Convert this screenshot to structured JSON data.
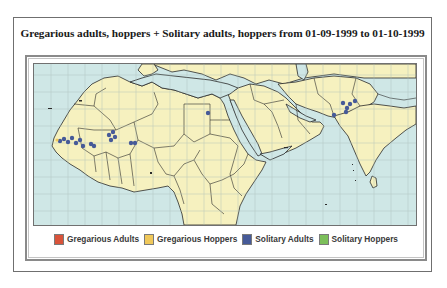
{
  "title": "Gregarious adults, hoppers + Solitary adults, hoppers from 01-09-1999 to 01-10-1999",
  "map": {
    "colors": {
      "sea": "#cfe7e6",
      "land": "#f6f1bf",
      "border": "#2a2a2a",
      "grid": "#a9bdbb"
    },
    "grid_spacing_px": 17,
    "observations": [
      {
        "type": "solitary_adults",
        "region": "Mauritania",
        "x": 26,
        "y": 77
      },
      {
        "type": "solitary_adults",
        "region": "Mauritania",
        "x": 30,
        "y": 75
      },
      {
        "type": "solitary_adults",
        "region": "Mauritania",
        "x": 34,
        "y": 78
      },
      {
        "type": "solitary_adults",
        "region": "Mauritania",
        "x": 38,
        "y": 74
      },
      {
        "type": "solitary_adults",
        "region": "Mauritania",
        "x": 42,
        "y": 79
      },
      {
        "type": "solitary_adults",
        "region": "Mauritania",
        "x": 46,
        "y": 76
      },
      {
        "type": "solitary_adults",
        "region": "Mauritania",
        "x": 49,
        "y": 82
      },
      {
        "type": "solitary_adults",
        "region": "Mali",
        "x": 57,
        "y": 80
      },
      {
        "type": "solitary_adults",
        "region": "Mali",
        "x": 60,
        "y": 82
      },
      {
        "type": "solitary_adults",
        "region": "Mali",
        "x": 75,
        "y": 71
      },
      {
        "type": "solitary_adults",
        "region": "Mali",
        "x": 77,
        "y": 76
      },
      {
        "type": "solitary_adults",
        "region": "Mali",
        "x": 79,
        "y": 68
      },
      {
        "type": "solitary_adults",
        "region": "Mali",
        "x": 81,
        "y": 73
      },
      {
        "type": "solitary_adults",
        "region": "Niger",
        "x": 97,
        "y": 79
      },
      {
        "type": "solitary_adults",
        "region": "Niger",
        "x": 101,
        "y": 79
      },
      {
        "type": "solitary_adults",
        "region": "Egypt",
        "x": 174,
        "y": 49
      },
      {
        "type": "solitary_adults",
        "region": "Pakistan",
        "x": 309,
        "y": 39
      },
      {
        "type": "solitary_adults",
        "region": "India",
        "x": 313,
        "y": 44
      },
      {
        "type": "solitary_adults",
        "region": "India",
        "x": 316,
        "y": 40
      },
      {
        "type": "solitary_adults",
        "region": "India",
        "x": 312,
        "y": 48
      },
      {
        "type": "solitary_adults",
        "region": "India",
        "x": 300,
        "y": 51
      },
      {
        "type": "solitary_adults",
        "region": "India",
        "x": 321,
        "y": 37
      },
      {
        "type": "gregarious_hoppers",
        "region": "Mauritania",
        "x": 23,
        "y": 76
      }
    ]
  },
  "legend": [
    {
      "key": "gregarious_adults",
      "label": "Gregarious Adults",
      "color": "#d9533a"
    },
    {
      "key": "gregarious_hoppers",
      "label": "Gregarious Hoppers",
      "color": "#f0c85a"
    },
    {
      "key": "solitary_adults",
      "label": "Solitary Adults",
      "color": "#465a98"
    },
    {
      "key": "solitary_hoppers",
      "label": "Solitary Hoppers",
      "color": "#7cbf5a"
    }
  ]
}
